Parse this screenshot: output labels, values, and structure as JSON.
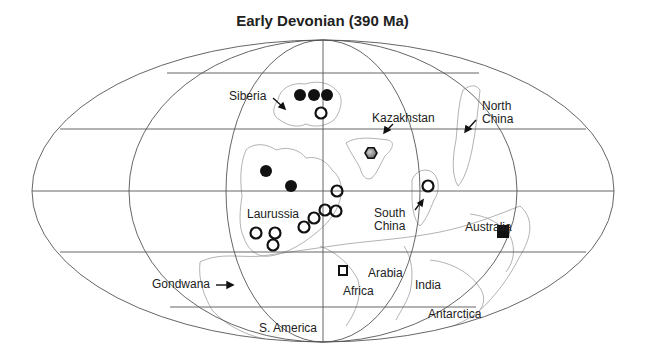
{
  "title": "Early Devonian (390 Ma)",
  "projection": {
    "type": "mollweide",
    "center": [
      323,
      191
    ],
    "rx": 291,
    "ry": 151,
    "meridian_half_widths": [
      97,
      194
    ],
    "parallels_y": [
      73,
      129,
      191,
      252,
      307
    ]
  },
  "labels": {
    "siberia": "Siberia",
    "kazakhstan": "Kazakhstan",
    "north_china_1": "North",
    "north_china_2": "China",
    "laurussia": "Laurussia",
    "south_china_1": "South",
    "south_china_2": "China",
    "australia": "Australia",
    "arabia": "Arabia",
    "india": "India",
    "gondwana": "Gondwana",
    "africa": "Africa",
    "antarctica": "Antarctica",
    "s_america": "S. America"
  },
  "markers": [
    {
      "type": "filled-circle",
      "region": "Siberia",
      "x": 300,
      "y": 95
    },
    {
      "type": "filled-circle",
      "region": "Siberia",
      "x": 314,
      "y": 95
    },
    {
      "type": "filled-circle",
      "region": "Siberia",
      "x": 327,
      "y": 95
    },
    {
      "type": "open-circle",
      "region": "Siberia",
      "x": 321,
      "y": 113
    },
    {
      "type": "hexagon",
      "region": "Kazakhstan",
      "x": 371,
      "y": 153
    },
    {
      "type": "filled-circle",
      "region": "Laurussia",
      "x": 266,
      "y": 171
    },
    {
      "type": "filled-circle",
      "region": "Laurussia",
      "x": 291,
      "y": 186
    },
    {
      "type": "open-circle",
      "region": "Laurussia",
      "x": 337,
      "y": 191
    },
    {
      "type": "open-circle",
      "region": "South China",
      "x": 428,
      "y": 186
    },
    {
      "type": "open-circle",
      "region": "Laurussia",
      "x": 325,
      "y": 210
    },
    {
      "type": "open-circle",
      "region": "Laurussia",
      "x": 336,
      "y": 211
    },
    {
      "type": "open-circle",
      "region": "Laurussia",
      "x": 314,
      "y": 218
    },
    {
      "type": "open-circle",
      "region": "Laurussia",
      "x": 304,
      "y": 227
    },
    {
      "type": "open-circle",
      "region": "Laurussia",
      "x": 256,
      "y": 233
    },
    {
      "type": "open-circle",
      "region": "Laurussia",
      "x": 275,
      "y": 233
    },
    {
      "type": "open-circle",
      "region": "Laurussia",
      "x": 273,
      "y": 245
    },
    {
      "type": "filled-square",
      "region": "Australia",
      "x": 503,
      "y": 232
    },
    {
      "type": "open-square",
      "region": "Africa",
      "x": 343,
      "y": 270
    }
  ],
  "colors": {
    "grid": "#555555",
    "coast": "#9a9a9a",
    "marker": "#111111",
    "hexagon_fill": "#7a7a7a"
  }
}
